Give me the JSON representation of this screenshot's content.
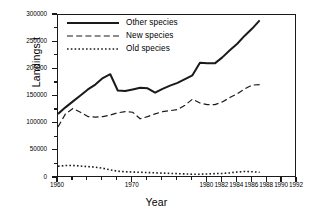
{
  "chart_data": {
    "type": "line",
    "title": "",
    "xlabel": "Year",
    "ylabel": "Landings t",
    "xlim": [
      1960,
      1992
    ],
    "ylim": [
      0,
      300000
    ],
    "grid": false,
    "legend_position": "top-left inside axes",
    "x": [
      1960,
      1961,
      1962,
      1963,
      1964,
      1965,
      1966,
      1967,
      1968,
      1969,
      1970,
      1971,
      1972,
      1973,
      1974,
      1975,
      1976,
      1977,
      1978,
      1979,
      1980,
      1981,
      1982,
      1983,
      1984,
      1985,
      1986,
      1987,
      1988,
      1989,
      1990,
      1991,
      1992
    ],
    "xticks_major": [
      1960,
      1970,
      1980,
      1982,
      1984,
      1986,
      1988,
      1990,
      1992
    ],
    "xtick_labels": [
      "1960",
      "1970",
      "1980",
      "1982",
      "1984",
      "1986",
      "1988",
      "1990",
      "1992"
    ],
    "yticks_major": [
      0,
      50000,
      100000,
      150000,
      200000,
      250000,
      300000
    ],
    "ytick_labels": [
      "0",
      "50000",
      "100000",
      "150000",
      "200000",
      "250000",
      "300000"
    ],
    "yticks_minor": [
      25000,
      75000,
      125000,
      175000,
      225000,
      275000
    ],
    "series": [
      {
        "name": "Other species",
        "style": "solid",
        "color": "#1a1a1a",
        "width": 2.0,
        "values": [
          118000,
          130000,
          141000,
          152000,
          163000,
          172000,
          184000,
          191000,
          161000,
          160000,
          163000,
          166000,
          165000,
          157000,
          164000,
          170000,
          175000,
          182000,
          189000,
          212000,
          211000,
          211000,
          222000,
          235000,
          247000,
          262000,
          275000,
          290000,
          null,
          null,
          null,
          null,
          null
        ]
      },
      {
        "name": "New species",
        "style": "dashed",
        "color": "#1a1a1a",
        "width": 1.2,
        "values": [
          94000,
          118000,
          128000,
          121000,
          113000,
          112000,
          113000,
          116000,
          120000,
          122000,
          121000,
          109000,
          113000,
          118000,
          122000,
          124000,
          126000,
          134000,
          145000,
          138000,
          135000,
          135000,
          140000,
          148000,
          155000,
          164000,
          171000,
          172000,
          null,
          null,
          null,
          null,
          null
        ]
      },
      {
        "name": "Old species",
        "style": "dotted",
        "color": "#1a1a1a",
        "width": 1.6,
        "values": [
          21500,
          23000,
          23000,
          22000,
          21000,
          20000,
          18000,
          15000,
          12500,
          11500,
          11000,
          10500,
          10000,
          9500,
          9000,
          8500,
          8000,
          7500,
          7000,
          7000,
          7500,
          8000,
          8500,
          9500,
          11000,
          12000,
          11500,
          10500,
          null,
          null,
          null,
          null,
          null
        ]
      }
    ],
    "series_x": [
      1960,
      1961,
      1962,
      1963,
      1964,
      1965,
      1966,
      1967,
      1968,
      1969,
      1970,
      1971,
      1972,
      1973,
      1974,
      1975,
      1976,
      1977,
      1978,
      1979,
      1980,
      1981,
      1982,
      1983,
      1984,
      1985,
      1986,
      1987,
      1988,
      1989,
      1990,
      1991,
      1992
    ]
  },
  "legend": {
    "items": [
      {
        "label": "Other species"
      },
      {
        "label": "New species"
      },
      {
        "label": "Old species"
      }
    ]
  }
}
